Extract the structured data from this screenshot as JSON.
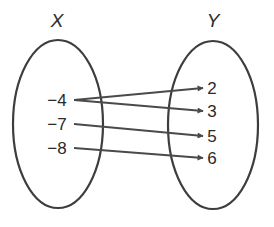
{
  "domain_set": {
    "label": "X",
    "elements": [
      "−4",
      "−7",
      "−8"
    ]
  },
  "range_set": {
    "label": "Y",
    "elements": [
      "2",
      "3",
      "5",
      "6"
    ]
  },
  "mappings": [
    {
      "from": "−4",
      "to": "2"
    },
    {
      "from": "−4",
      "to": "3"
    },
    {
      "from": "−7",
      "to": "5"
    },
    {
      "from": "−8",
      "to": "6"
    }
  ],
  "colors": {
    "stroke": "#3d3d3d",
    "arrow": "#4a4a4a",
    "text": "#2a2a2a",
    "background": "#ffffff"
  }
}
